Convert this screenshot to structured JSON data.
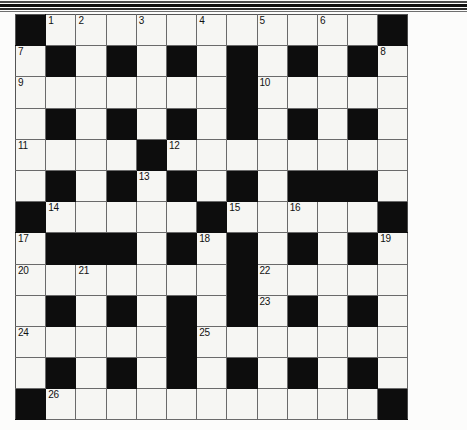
{
  "document": {
    "kind": "crossword-puzzle-grid",
    "title": "",
    "grid": {
      "rows": 13,
      "cols": 13,
      "cell_size_px": 30,
      "block_color": "#0d0d0d",
      "cell_color": "#f6f6f3",
      "line_color": "#6a6a6a",
      "number_color": "#111111",
      "layout": [
        [
          "#",
          "1",
          "2",
          "",
          "3",
          "",
          "4",
          "",
          "5",
          "",
          "6",
          "",
          "#"
        ],
        [
          "7",
          "#",
          "",
          "#",
          "",
          "#",
          "",
          "#",
          "",
          "#",
          "",
          "#",
          "8"
        ],
        [
          "9",
          "",
          "",
          "",
          "",
          "",
          "",
          "#",
          "10",
          "",
          "",
          "",
          ""
        ],
        [
          "",
          "#",
          "",
          "#",
          "",
          "#",
          "",
          "#",
          "",
          "#",
          "",
          "#",
          ""
        ],
        [
          "11",
          "",
          "",
          "",
          "#",
          "12",
          "",
          "",
          "",
          "",
          "",
          "",
          ""
        ],
        [
          "",
          "#",
          "",
          "#",
          "13",
          "#",
          "",
          "#",
          "",
          "#",
          "#",
          "#",
          ""
        ],
        [
          "#",
          "14",
          "",
          "",
          "",
          "",
          "#",
          "15",
          "",
          "16",
          "",
          "",
          "#"
        ],
        [
          "17",
          "#",
          "#",
          "#",
          "",
          "#",
          "18",
          "#",
          "",
          "#",
          "",
          "#",
          "19"
        ],
        [
          "20",
          "",
          "21",
          "",
          "",
          "",
          "",
          "#",
          "22",
          "",
          "",
          "",
          ""
        ],
        [
          "",
          "#",
          "",
          "#",
          "",
          "#",
          "",
          "#",
          "23",
          "#",
          "",
          "#",
          ""
        ],
        [
          "24",
          "",
          "",
          "",
          "",
          "#",
          "25",
          "",
          "",
          "",
          "",
          "",
          ""
        ],
        [
          "",
          "#",
          "",
          "#",
          "",
          "#",
          "",
          "#",
          "",
          "#",
          "",
          "#",
          ""
        ],
        [
          "#",
          "26",
          "",
          "",
          "",
          "",
          "",
          "",
          "",
          "",
          "",
          "",
          "#"
        ]
      ],
      "numbers_in_reading_order": [
        1,
        2,
        3,
        4,
        5,
        6,
        7,
        8,
        9,
        10,
        11,
        12,
        13,
        14,
        15,
        16,
        17,
        18,
        19,
        20,
        21,
        22,
        23,
        24,
        25,
        26
      ],
      "entered_letters": []
    },
    "top_rules": {
      "count": 4,
      "colors": [
        "#4a4a4a",
        "#101010",
        "#2c2c2c",
        "#6e6e6e"
      ]
    }
  }
}
